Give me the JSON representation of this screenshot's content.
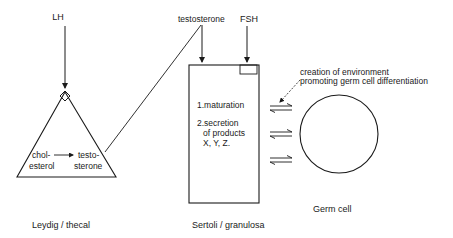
{
  "diagram": {
    "leydig": {
      "input_hormone": "LH",
      "conversion_from_line1": "chol-",
      "conversion_from_line2": "esterol",
      "conversion_to_line1": "testo-",
      "conversion_to_line2": "sterone",
      "caption": "Leydig / thecal"
    },
    "sertoli": {
      "input_testosterone": "testosterone",
      "input_fsh": "FSH",
      "function_1": "1.maturation",
      "function_2_line1": "2.secretion",
      "function_2_line2": "of products",
      "function_2_line3": "X, Y, Z.",
      "caption": "Sertoli / granulosa"
    },
    "germ_cell": {
      "annotation_line1": "creation of environment",
      "annotation_line2": "promoting germ cell differentiation",
      "caption": "Germ cell"
    },
    "colors": {
      "line": "#1a1a1a",
      "background": "#ffffff"
    }
  }
}
